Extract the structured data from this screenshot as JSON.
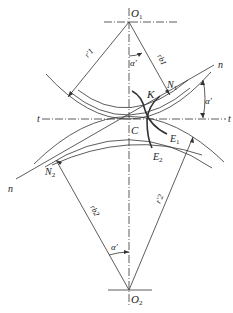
{
  "diagram": {
    "labels": {
      "O1": "O",
      "O1_sub": "1",
      "O2": "O",
      "O2_sub": "2",
      "C": "C",
      "K": "K",
      "N1": "N",
      "N1_sub": "1",
      "N2": "N",
      "N2_sub": "2",
      "E1": "E",
      "E1_sub": "1",
      "E2": "E",
      "E2_sub": "2",
      "t_left": "t",
      "t_right": "t",
      "n_upper": "n",
      "n_lower": "n",
      "alpha_top": "α′",
      "alpha_right": "α′",
      "alpha_bottom": "α′",
      "r_prime_1": "r′1",
      "rb1": "rb1",
      "r_prime_2": "r′2",
      "rb2": "rb2"
    },
    "colors": {
      "line": "#333333",
      "background": "#ffffff"
    }
  }
}
